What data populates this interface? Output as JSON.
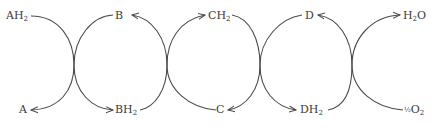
{
  "diagram": {
    "type": "redox-chain",
    "stroke_color": "#4a4a4a",
    "text_color": "#3a3a3a",
    "labels": {
      "ah2": {
        "base": "AH",
        "sub": "2"
      },
      "a": {
        "base": "A",
        "sub": ""
      },
      "b": {
        "base": "B",
        "sub": ""
      },
      "bh2": {
        "base": "BH",
        "sub": "2"
      },
      "ch2": {
        "base": "CH",
        "sub": "2"
      },
      "c": {
        "base": "C",
        "sub": ""
      },
      "d": {
        "base": "D",
        "sub": ""
      },
      "dh2": {
        "base": "DH",
        "sub": "2"
      },
      "h2o": {
        "base": "H",
        "sub": "2",
        "tail": "O"
      },
      "half_o2": {
        "frac": "½",
        "base": "O",
        "sub": "2"
      }
    },
    "arrows": [
      {
        "from": "AH2",
        "to": "BH2"
      },
      {
        "from": "B",
        "to": "A"
      },
      {
        "from": "BH2",
        "to": "B"
      },
      {
        "from": "C",
        "to": "CH2"
      },
      {
        "from": "CH2",
        "to": "C"
      },
      {
        "from": "DH2",
        "to": "D"
      },
      {
        "from": "D",
        "to": "DH2"
      },
      {
        "from": "half_O2",
        "to": "H2O"
      }
    ]
  }
}
